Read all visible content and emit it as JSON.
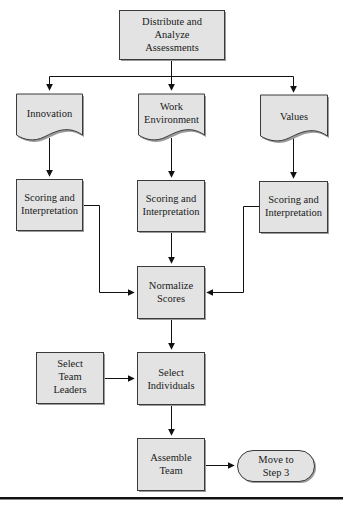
{
  "diagram": {
    "type": "flowchart",
    "colors": {
      "box_fill": "#e3e3e3",
      "box_stroke": "#3a3a3a",
      "shadow": "#9a9a9a",
      "line": "#111111",
      "bottom_rule": "#111111"
    },
    "nodes": {
      "distribute": {
        "shape": "process",
        "lines": [
          "Distribute and",
          "Analyze",
          "Assessments"
        ]
      },
      "innovation": {
        "shape": "document",
        "lines": [
          "Innovation"
        ]
      },
      "work_environment": {
        "shape": "document",
        "lines": [
          "Work",
          "Environment"
        ]
      },
      "values": {
        "shape": "document",
        "lines": [
          "Values"
        ]
      },
      "scoring_left": {
        "shape": "process",
        "lines": [
          "Scoring and",
          "Interpretation"
        ]
      },
      "scoring_mid": {
        "shape": "process",
        "lines": [
          "Scoring and",
          "Interpretation"
        ]
      },
      "scoring_right": {
        "shape": "process",
        "lines": [
          "Scoring and",
          "Interpretation"
        ]
      },
      "normalize": {
        "shape": "process",
        "lines": [
          "Normalize",
          "Scores"
        ]
      },
      "select_leaders": {
        "shape": "process",
        "lines": [
          "Select",
          "Team",
          "Leaders"
        ]
      },
      "select_individuals": {
        "shape": "process",
        "lines": [
          "Select",
          "Individuals"
        ]
      },
      "assemble": {
        "shape": "process",
        "lines": [
          "Assemble",
          "Team"
        ]
      },
      "move_step3": {
        "shape": "terminator",
        "lines": [
          "Move to",
          "Step 3"
        ]
      }
    },
    "edges": [
      {
        "from": "distribute",
        "to": "innovation"
      },
      {
        "from": "distribute",
        "to": "work_environment"
      },
      {
        "from": "distribute",
        "to": "values"
      },
      {
        "from": "innovation",
        "to": "scoring_left"
      },
      {
        "from": "work_environment",
        "to": "scoring_mid"
      },
      {
        "from": "values",
        "to": "scoring_right"
      },
      {
        "from": "scoring_left",
        "to": "normalize"
      },
      {
        "from": "scoring_mid",
        "to": "normalize"
      },
      {
        "from": "scoring_right",
        "to": "normalize"
      },
      {
        "from": "normalize",
        "to": "select_individuals"
      },
      {
        "from": "select_leaders",
        "to": "select_individuals"
      },
      {
        "from": "select_individuals",
        "to": "assemble"
      },
      {
        "from": "assemble",
        "to": "move_step3"
      }
    ]
  }
}
